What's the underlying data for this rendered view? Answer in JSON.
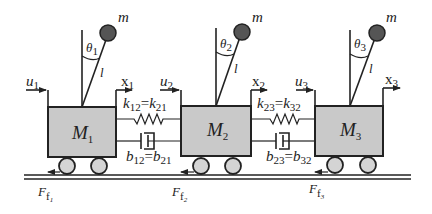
{
  "diagram": {
    "carts": [
      {
        "id": 1,
        "mass_label": "M",
        "mass_sub": "1",
        "input_label": "u",
        "input_sub": "1",
        "pos_label": "x",
        "pos_sub": "1",
        "angle_label": "θ",
        "angle_sub": "1",
        "bob_label": "m",
        "length_label": "l",
        "friction_label": "F",
        "friction_sub": "f",
        "friction_sub2": "1"
      },
      {
        "id": 2,
        "mass_label": "M",
        "mass_sub": "2",
        "input_label": "u",
        "input_sub": "2",
        "pos_label": "x",
        "pos_sub": "2",
        "angle_label": "θ",
        "angle_sub": "2",
        "bob_label": "m",
        "length_label": "l",
        "friction_label": "F",
        "friction_sub": "f",
        "friction_sub2": "2"
      },
      {
        "id": 3,
        "mass_label": "M",
        "mass_sub": "3",
        "input_label": "u",
        "input_sub": "3",
        "pos_label": "x",
        "pos_sub": "3",
        "angle_label": "θ",
        "angle_sub": "3",
        "bob_label": "m",
        "length_label": "l",
        "friction_label": "F",
        "friction_sub": "f",
        "friction_sub2": "3"
      }
    ],
    "couplings": [
      {
        "spring": {
          "a": "k",
          "a_sub": "12",
          "eq": "=",
          "b": "k",
          "b_sub": "21"
        },
        "damper": {
          "a": "b",
          "a_sub": "12",
          "eq": "=",
          "b": "b",
          "b_sub": "21"
        }
      },
      {
        "spring": {
          "a": "k",
          "a_sub": "23",
          "eq": "=",
          "b": "k",
          "b_sub": "32"
        },
        "damper": {
          "a": "b",
          "a_sub": "23",
          "eq": "=",
          "b": "b",
          "b_sub": "32"
        }
      }
    ],
    "colors": {
      "cart_fill": "#c9c9c9",
      "wheel_fill": "#d4d4d4",
      "bob_fill": "#555555",
      "stroke": "#222222"
    }
  }
}
